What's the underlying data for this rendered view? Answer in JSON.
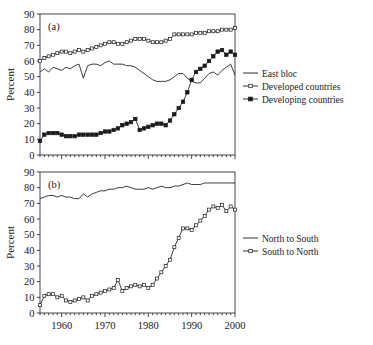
{
  "figure": {
    "panels": [
      {
        "id": "a",
        "label": "(a)",
        "ylabel": "Percent",
        "legend": [
          {
            "name": "East bloc",
            "marker": "line"
          },
          {
            "name": "Developed countries",
            "marker": "open-square"
          },
          {
            "name": "Developing countries",
            "marker": "filled-square"
          }
        ]
      },
      {
        "id": "b",
        "label": "(b)",
        "ylabel": "Percent",
        "legend": [
          {
            "name": "North to South",
            "marker": "line"
          },
          {
            "name": "South to North",
            "marker": "open-square"
          }
        ]
      }
    ]
  },
  "chart_data": [
    {
      "type": "line",
      "panel": "(a)",
      "title": "",
      "xlabel": "",
      "ylabel": "Percent",
      "xlim": [
        1955,
        2000
      ],
      "ylim": [
        0,
        90
      ],
      "xticks": [
        1960,
        1970,
        1980,
        1990,
        2000
      ],
      "yticks": [
        0,
        10,
        20,
        30,
        40,
        50,
        60,
        70,
        80,
        90
      ],
      "xticklabels": [
        "",
        "",
        "",
        "",
        ""
      ],
      "yticklabels": [
        "0",
        "10",
        "20",
        "30",
        "40",
        "50",
        "60",
        "70",
        "80",
        "90"
      ],
      "grid": false,
      "legend_position": "right",
      "x": [
        1955,
        1956,
        1957,
        1958,
        1959,
        1960,
        1961,
        1962,
        1963,
        1964,
        1965,
        1966,
        1967,
        1968,
        1969,
        1970,
        1971,
        1972,
        1973,
        1974,
        1975,
        1976,
        1977,
        1978,
        1979,
        1980,
        1981,
        1982,
        1983,
        1984,
        1985,
        1986,
        1987,
        1988,
        1989,
        1990,
        1991,
        1992,
        1993,
        1994,
        1995,
        1996,
        1997,
        1998,
        1999,
        2000
      ],
      "series": [
        {
          "name": "East bloc",
          "marker": "none",
          "values": [
            53,
            55,
            53,
            56,
            55,
            54,
            56,
            55,
            57,
            58,
            49,
            57,
            58,
            58,
            57,
            59,
            60,
            58,
            58,
            58,
            57,
            57,
            56,
            54,
            52,
            50,
            48,
            47,
            47,
            47,
            48,
            50,
            52,
            52,
            49,
            47,
            46,
            46,
            49,
            52,
            53,
            51,
            54,
            56,
            58,
            51
          ]
        },
        {
          "name": "Developed countries",
          "marker": "open-square",
          "values": [
            60,
            62,
            63,
            64,
            65,
            66,
            66,
            65,
            66,
            67,
            66,
            67,
            68,
            69,
            70,
            71,
            72,
            72,
            71,
            71,
            72,
            73,
            74,
            74,
            74,
            73,
            72,
            72,
            72,
            73,
            74,
            77,
            77,
            77,
            77,
            77,
            78,
            78,
            78,
            79,
            79,
            79,
            80,
            80,
            80,
            81
          ]
        },
        {
          "name": "Developing countries",
          "marker": "filled-square",
          "values": [
            9,
            13,
            14,
            14,
            14,
            13,
            12,
            12,
            12,
            13,
            13,
            13,
            13,
            13,
            14,
            15,
            15,
            16,
            17,
            19,
            20,
            21,
            23,
            16,
            17,
            18,
            19,
            20,
            20,
            19,
            22,
            26,
            30,
            34,
            40,
            48,
            53,
            55,
            57,
            60,
            63,
            66,
            67,
            64,
            66,
            64
          ]
        }
      ]
    },
    {
      "type": "line",
      "panel": "(b)",
      "title": "",
      "xlabel": "",
      "ylabel": "Percent",
      "xlim": [
        1955,
        2000
      ],
      "ylim": [
        0,
        90
      ],
      "xticks": [
        1960,
        1970,
        1980,
        1990,
        2000
      ],
      "yticks": [
        0,
        10,
        20,
        30,
        40,
        50,
        60,
        70,
        80,
        90
      ],
      "xticklabels": [
        "1960",
        "1970",
        "1980",
        "1990",
        "2000"
      ],
      "yticklabels": [
        "0",
        "10",
        "20",
        "30",
        "40",
        "50",
        "60",
        "70",
        "80",
        "90"
      ],
      "grid": false,
      "legend_position": "right",
      "x": [
        1955,
        1956,
        1957,
        1958,
        1959,
        1960,
        1961,
        1962,
        1963,
        1964,
        1965,
        1966,
        1967,
        1968,
        1969,
        1970,
        1971,
        1972,
        1973,
        1974,
        1975,
        1976,
        1977,
        1978,
        1979,
        1980,
        1981,
        1982,
        1983,
        1984,
        1985,
        1986,
        1987,
        1988,
        1989,
        1990,
        1991,
        1992,
        1993,
        1994,
        1995,
        1996,
        1997,
        1998,
        1999,
        2000
      ],
      "series": [
        {
          "name": "North to South",
          "marker": "none",
          "values": [
            73,
            74,
            75,
            75,
            74,
            75,
            74,
            74,
            73,
            73,
            76,
            74,
            76,
            77,
            78,
            78,
            79,
            79,
            80,
            80,
            81,
            80,
            79,
            79,
            79,
            80,
            79,
            80,
            81,
            80,
            80,
            81,
            81,
            82,
            83,
            82,
            82,
            82,
            83,
            83,
            83,
            83,
            83,
            83,
            83,
            83
          ]
        },
        {
          "name": "South to North",
          "marker": "open-square",
          "values": [
            5,
            11,
            12,
            12,
            10,
            11,
            8,
            7,
            8,
            9,
            10,
            8,
            11,
            12,
            13,
            14,
            15,
            16,
            21,
            14,
            16,
            17,
            18,
            17,
            18,
            16,
            18,
            22,
            26,
            30,
            34,
            42,
            48,
            54,
            54,
            53,
            56,
            59,
            62,
            66,
            68,
            67,
            69,
            65,
            68,
            66
          ]
        }
      ]
    }
  ]
}
